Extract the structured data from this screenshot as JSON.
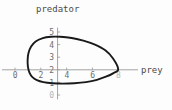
{
  "chart_data": {
    "type": "line",
    "title": "",
    "xlabel": "prey",
    "ylabel": "predator",
    "xlim": [
      0,
      9.2
    ],
    "ylim": [
      0,
      5.4
    ],
    "grid": false,
    "legend": null,
    "xticks": [
      {
        "value": 0,
        "label": "0"
      },
      {
        "value": 2,
        "label": "2"
      },
      {
        "value": 4,
        "label": "4"
      },
      {
        "value": 6,
        "label": "6"
      },
      {
        "value": 8,
        "label": "8"
      }
    ],
    "yticks": [
      {
        "value": 0,
        "label": "0"
      },
      {
        "value": 1,
        "label": "1"
      },
      {
        "value": 2,
        "label": "2"
      },
      {
        "value": 3,
        "label": "3"
      },
      {
        "value": 4,
        "label": "4"
      },
      {
        "value": 5,
        "label": "5"
      }
    ],
    "series": [
      {
        "name": "predator-prey orbit",
        "closed": true,
        "color": "#1a1a1a",
        "points": [
          [
            8.0,
            2.05
          ],
          [
            7.6,
            2.9
          ],
          [
            7.0,
            3.55
          ],
          [
            6.2,
            4.0
          ],
          [
            5.3,
            4.32
          ],
          [
            4.4,
            4.52
          ],
          [
            3.5,
            4.62
          ],
          [
            2.8,
            4.62
          ],
          [
            2.1,
            4.5
          ],
          [
            1.6,
            4.25
          ],
          [
            1.25,
            3.85
          ],
          [
            1.05,
            3.35
          ],
          [
            0.98,
            2.8
          ],
          [
            1.0,
            2.25
          ],
          [
            1.12,
            1.78
          ],
          [
            1.35,
            1.42
          ],
          [
            1.7,
            1.18
          ],
          [
            2.2,
            1.02
          ],
          [
            2.9,
            0.93
          ],
          [
            3.7,
            0.9
          ],
          [
            4.6,
            0.93
          ],
          [
            5.5,
            1.02
          ],
          [
            6.35,
            1.2
          ],
          [
            7.05,
            1.45
          ],
          [
            7.6,
            1.72
          ],
          [
            8.0,
            2.05
          ]
        ]
      }
    ]
  },
  "labels": {
    "title_text": "predator",
    "x_axis_text": "prey"
  }
}
